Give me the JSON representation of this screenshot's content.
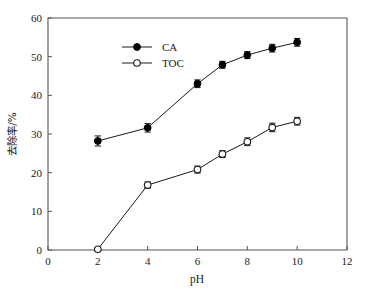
{
  "chart_data": {
    "type": "line",
    "title": "",
    "xlabel": "pH",
    "ylabel": "去除率/%",
    "xlim": [
      0,
      12
    ],
    "ylim": [
      0,
      60
    ],
    "x_ticks": [
      0,
      2,
      4,
      6,
      8,
      10,
      12
    ],
    "y_ticks": [
      0,
      10,
      20,
      30,
      40,
      50,
      60
    ],
    "x_tick_labels": [
      "0",
      "2",
      "4",
      "6",
      "8",
      "10",
      "12"
    ],
    "y_tick_labels": [
      "0",
      "10",
      "20",
      "30",
      "40",
      "50",
      "60"
    ],
    "grid": false,
    "legend_position": "upper-left-inside",
    "series": [
      {
        "name": "CA",
        "marker": "filled-circle",
        "x": [
          2,
          4,
          6,
          7,
          8,
          9,
          10
        ],
        "values": [
          28.2,
          31.6,
          43.0,
          47.9,
          50.4,
          52.2,
          53.7
        ],
        "errors": [
          1.3,
          1.1,
          1.0,
          0.9,
          0.9,
          1.0,
          1.0
        ]
      },
      {
        "name": "TOC",
        "marker": "open-circle",
        "x": [
          2,
          4,
          6,
          7,
          8,
          9,
          10
        ],
        "values": [
          0.2,
          16.8,
          20.8,
          24.8,
          28.0,
          31.7,
          33.3
        ],
        "errors": [
          0.4,
          0.8,
          0.9,
          0.9,
          1.0,
          1.1,
          1.0
        ]
      }
    ]
  },
  "legend": {
    "entries": [
      {
        "label": "CA"
      },
      {
        "label": "TOC"
      }
    ]
  },
  "axes": {
    "x_title": "pH",
    "y_title": "去除率/%"
  }
}
